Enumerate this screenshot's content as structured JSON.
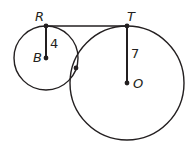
{
  "diagram": {
    "stroke_color": "#231f20",
    "circles": [
      {
        "name": "circle-B",
        "center": "B",
        "cx": 46,
        "cy": 58,
        "r": 32
      },
      {
        "name": "circle-O",
        "center": "O",
        "cx": 127,
        "cy": 83,
        "r": 57
      }
    ],
    "points": {
      "R": {
        "label": "R",
        "x": 46,
        "y": 26
      },
      "B": {
        "label": "B",
        "x": 46,
        "y": 58
      },
      "T": {
        "label": "T",
        "x": 127,
        "y": 26
      },
      "O": {
        "label": "O",
        "x": 127,
        "y": 83
      },
      "tangency": {
        "x": 76,
        "y": 68
      }
    },
    "segments": [
      {
        "from": "R",
        "to": "T",
        "kind": "common-tangent"
      },
      {
        "from": "R",
        "to": "B",
        "kind": "radius",
        "label": "4"
      },
      {
        "from": "T",
        "to": "O",
        "kind": "radius",
        "label": "7"
      }
    ],
    "radius_labels": {
      "RB": "4",
      "TO": "7"
    }
  }
}
